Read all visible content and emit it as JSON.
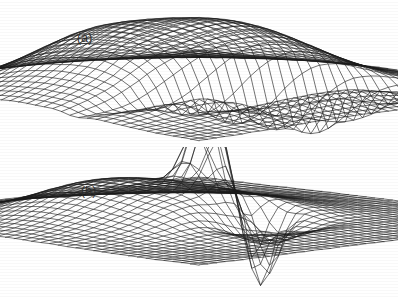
{
  "figure": {
    "background_color": "#ffffff",
    "ink_color": "#1a1a1a",
    "width": 398,
    "height": 297,
    "caption_font_size": 12
  },
  "panels": [
    {
      "id": "a",
      "label": "(a)",
      "label_x": 77,
      "label_y": 31,
      "description": "3D wireframe surface: broad smooth hill rising to a rounded ridge at back-centre with a narrow deep crease/valley cutting down on the right-hand flank",
      "projection": {
        "origin_x": 199,
        "origin_y": 96,
        "ax": 1.72,
        "ay": 0.455,
        "bx": -1.72,
        "by": 0.455,
        "z_scale": 1.0
      },
      "grid": {
        "nu": 41,
        "nv": 41,
        "u_min": -1,
        "u_max": 1,
        "v_min": -1,
        "v_max": 1
      },
      "stroke_width": 0.62,
      "surface_terms": [
        {
          "kind": "gauss",
          "amp": 66,
          "cx": -0.06,
          "cy": 0.12,
          "sx": 0.46,
          "sy": 0.52,
          "rot": 0.18
        },
        {
          "kind": "gauss",
          "amp": 20,
          "cx": 0.24,
          "cy": -0.12,
          "sx": 0.3,
          "sy": 0.34,
          "rot": 0.0
        },
        {
          "kind": "gauss",
          "amp": 13,
          "cx": -0.34,
          "cy": 0.34,
          "sx": 0.22,
          "sy": 0.2,
          "rot": 0.0
        },
        {
          "kind": "gauss",
          "amp": -62,
          "cx": 0.49,
          "cy": 0.05,
          "sx": 0.055,
          "sy": 0.4,
          "rot": 0.22
        },
        {
          "kind": "gauss",
          "amp": -30,
          "cx": 0.6,
          "cy": 0.1,
          "sx": 0.05,
          "sy": 0.26,
          "rot": 0.0
        },
        {
          "kind": "gauss",
          "amp": 9,
          "cx": 0.05,
          "cy": 0.48,
          "sx": 0.13,
          "sy": 0.12,
          "rot": 0.0
        }
      ]
    },
    {
      "id": "b",
      "label": "(b)",
      "label_x": 81,
      "label_y": 184,
      "description": "3D wireframe surface: tall narrow spike rising sharply from a gently sloping plane, with an equally narrow deep downward spike immediately in front of it piercing below the base plane",
      "projection": {
        "origin_x": 199,
        "origin_y": 74,
        "ax": 1.76,
        "ay": 0.44,
        "bx": -1.76,
        "by": 0.44,
        "z_scale": 1.0
      },
      "grid": {
        "nu": 41,
        "nv": 41,
        "u_min": -1,
        "u_max": 1,
        "v_min": -1,
        "v_max": 1
      },
      "stroke_width": 0.62,
      "surface_terms": [
        {
          "kind": "gauss",
          "amp": 96,
          "cx": 0.08,
          "cy": 0.02,
          "sx": 0.075,
          "sy": 0.085,
          "rot": 0.0
        },
        {
          "kind": "gauss",
          "amp": 34,
          "cx": -0.1,
          "cy": 0.1,
          "sx": 0.36,
          "sy": 0.42,
          "rot": 0.12
        },
        {
          "kind": "gauss",
          "amp": 14,
          "cx": -0.38,
          "cy": 0.3,
          "sx": 0.26,
          "sy": 0.24,
          "rot": 0.0
        },
        {
          "kind": "gauss",
          "amp": -88,
          "cx": 0.2,
          "cy": -0.14,
          "sx": 0.07,
          "sy": 0.075,
          "rot": 0.0
        },
        {
          "kind": "gauss",
          "amp": -26,
          "cx": 0.42,
          "cy": 0.06,
          "sx": 0.09,
          "sy": 0.2,
          "rot": 0.0
        },
        {
          "kind": "gauss",
          "amp": 10,
          "cx": 0.3,
          "cy": 0.3,
          "sx": 0.18,
          "sy": 0.16,
          "rot": 0.0
        }
      ]
    }
  ]
}
